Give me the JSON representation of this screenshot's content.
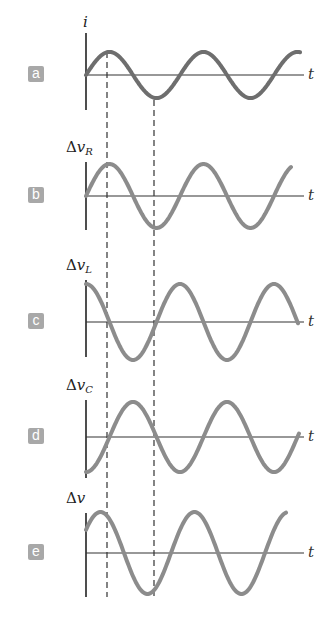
{
  "chart_data": {
    "type": "line",
    "title": "",
    "xlabel": "t",
    "shared_time_markers": [
      "peak of i",
      "trough of i"
    ],
    "panels": [
      {
        "id": "a",
        "badge": "a",
        "ylabel": "i",
        "ylabel_sub": "",
        "ylabel_delta": "",
        "waveform": "sin",
        "phase_deg": 0,
        "amplitude_rel": 0.6,
        "color": "#6e6e6e",
        "baseline_y": 75,
        "amp_px": 23,
        "axis_top": 33,
        "axis_bottom": 110,
        "phase_px": 0,
        "x_end": 300
      },
      {
        "id": "b",
        "badge": "b",
        "ylabel": "v",
        "ylabel_sub": "R",
        "ylabel_delta": "Δ",
        "waveform": "sin",
        "phase_deg": 0,
        "amplitude_rel": 0.85,
        "color": "#8c8c8c",
        "baseline_y": 196,
        "amp_px": 32,
        "axis_top": 162,
        "axis_bottom": 230,
        "phase_px": 0,
        "x_end": 291
      },
      {
        "id": "c",
        "badge": "c",
        "ylabel": "v",
        "ylabel_sub": "L",
        "ylabel_delta": "Δ",
        "waveform": "cos",
        "phase_deg": 90,
        "amplitude_rel": 1.0,
        "color": "#8c8c8c",
        "baseline_y": 322,
        "amp_px": 38,
        "axis_top": 280,
        "axis_bottom": 357,
        "phase_px": 23.5,
        "x_end": 298
      },
      {
        "id": "d",
        "badge": "d",
        "ylabel": "v",
        "ylabel_sub": "C",
        "ylabel_delta": "Δ",
        "waveform": "-cos",
        "phase_deg": -90,
        "amplitude_rel": 0.9,
        "color": "#8c8c8c",
        "baseline_y": 437,
        "amp_px": 35,
        "axis_top": 400,
        "axis_bottom": 478,
        "phase_px": -23.5,
        "x_end": 299
      },
      {
        "id": "e",
        "badge": "e",
        "ylabel": "v",
        "ylabel_sub": "",
        "ylabel_delta": "Δ",
        "waveform": "sin",
        "phase_deg": 35,
        "amplitude_rel": 1.1,
        "color": "#8c8c8c",
        "baseline_y": 553,
        "amp_px": 41,
        "axis_top": 513,
        "axis_bottom": 597,
        "phase_px": 9,
        "x_end": 286
      }
    ],
    "layout": {
      "axis_x0": 86,
      "axis_x1": 304,
      "period_px": 94,
      "dashed_lines_x": [
        107,
        154
      ],
      "dash_top": 80,
      "dash_bottom": 597
    }
  }
}
